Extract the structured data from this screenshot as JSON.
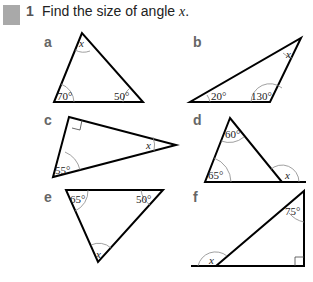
{
  "header": {
    "icon": "puzzle-icon",
    "number": "1",
    "text_before": "Find the size of angle ",
    "variable": "x",
    "text_after": "."
  },
  "parts": [
    {
      "label": "a",
      "angles": [
        "x",
        "70°",
        "50°"
      ]
    },
    {
      "label": "b",
      "angles": [
        "x",
        "20°",
        "130°"
      ]
    },
    {
      "label": "c",
      "angles": [
        "x",
        "55°"
      ],
      "right_angle": true
    },
    {
      "label": "d",
      "angles": [
        "60°",
        "65°",
        "x"
      ]
    },
    {
      "label": "e",
      "angles": [
        "65°",
        "50°",
        "x"
      ]
    },
    {
      "label": "f",
      "angles": [
        "75°",
        "x"
      ],
      "right_angle": true
    }
  ]
}
